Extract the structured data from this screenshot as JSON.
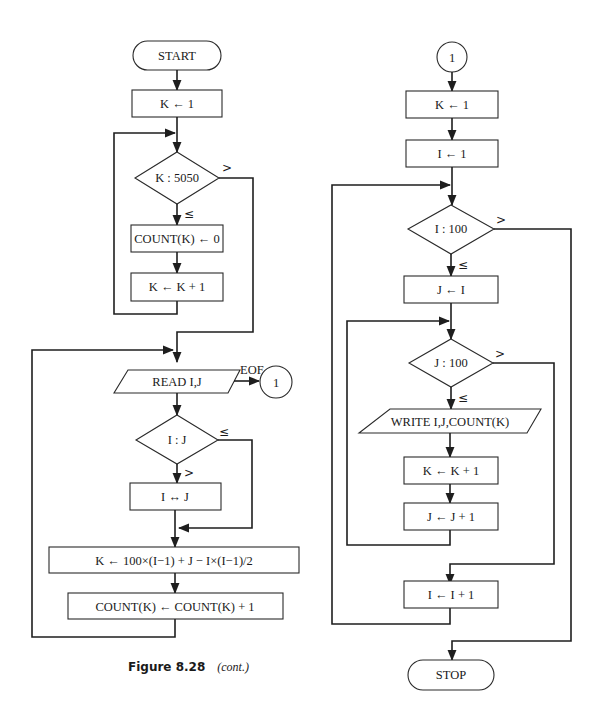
{
  "caption": {
    "figure": "Figure 8.28",
    "note": "(cont.)"
  },
  "left_flow": {
    "start": "START",
    "k_init": "K ← 1",
    "k_test": "K : 5050",
    "k_test_gt": ">",
    "k_test_le": "≤",
    "count_zero": "COUNT(K) ← 0",
    "k_inc": "K ← K + 1",
    "read": "READ I,J",
    "eof": "EOF",
    "connector": "1",
    "ij_test": "I : J",
    "ij_test_le": "≤",
    "ij_test_gt": ">",
    "swap": "I ↔ J",
    "k_compute": "K ← 100×(I−1) + J − I×(I−1)/2",
    "count_inc": "COUNT(K) ← COUNT(K) + 1"
  },
  "right_flow": {
    "connector": "1",
    "k_init": "K ← 1",
    "i_init": "I ← 1",
    "i_test": "I : 100",
    "i_test_gt": ">",
    "i_test_le": "≤",
    "j_init": "J ← I",
    "j_test": "J : 100",
    "j_test_gt": ">",
    "j_test_le": "≤",
    "write": "WRITE I,J,COUNT(K)",
    "k_inc": "K ← K + 1",
    "j_inc": "J ← J + 1",
    "i_inc": "I ← I + 1",
    "stop": "STOP"
  }
}
